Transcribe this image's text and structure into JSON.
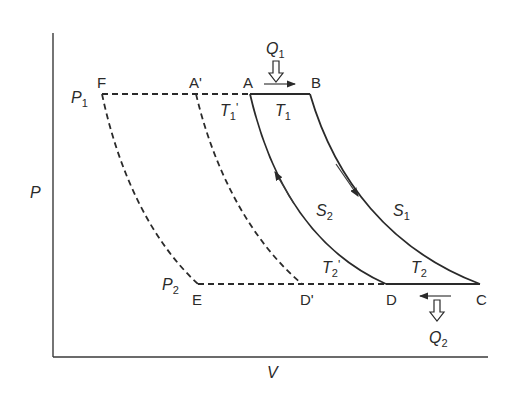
{
  "diagram": {
    "type": "P-V diagram (Carnot-like cycle with adiabats and isotherms)",
    "axes": {
      "y_label": "P",
      "x_label": "V"
    },
    "pressure_labels": {
      "p1": "P",
      "p1_sub": "1",
      "p2": "P",
      "p2_sub": "2"
    },
    "points": {
      "F": "F",
      "A_prime": "A'",
      "A": "A",
      "B": "B",
      "E": "E",
      "D_prime": "D'",
      "D": "D",
      "C": "C"
    },
    "temperature_labels": {
      "t1": "T",
      "t1_sub": "1",
      "t1_prime": "T",
      "t1_prime_sub": "1",
      "t1_prime_mark": "'",
      "t2": "T",
      "t2_sub": "2",
      "t2_prime": "T",
      "t2_prime_sub": "2",
      "t2_prime_mark": "'"
    },
    "entropy_labels": {
      "s1": "S",
      "s1_sub": "1",
      "s2": "S",
      "s2_sub": "2"
    },
    "heat_labels": {
      "q1": "Q",
      "q1_sub": "1",
      "q2": "Q",
      "q2_sub": "2"
    },
    "processes": [
      {
        "from": "A",
        "to": "B",
        "style": "solid",
        "kind": "isobaric heat addition at P1"
      },
      {
        "from": "B",
        "to": "C",
        "style": "solid",
        "kind": "adiabat S1"
      },
      {
        "from": "C",
        "to": "D",
        "style": "solid",
        "kind": "isobaric heat rejection at P2"
      },
      {
        "from": "D",
        "to": "A",
        "style": "solid",
        "kind": "adiabat S2"
      },
      {
        "from": "F",
        "to": "A",
        "style": "dashed",
        "kind": "P1 isobar extension"
      },
      {
        "from": "E",
        "to": "D",
        "style": "dashed",
        "kind": "P2 isobar extension"
      },
      {
        "from": "F",
        "to": "E",
        "style": "dashed",
        "kind": "curve"
      },
      {
        "from": "A'",
        "to": "D'",
        "style": "dashed",
        "kind": "curve"
      }
    ],
    "colors": {
      "line": "#2a2a2a",
      "background": "#ffffff"
    }
  }
}
